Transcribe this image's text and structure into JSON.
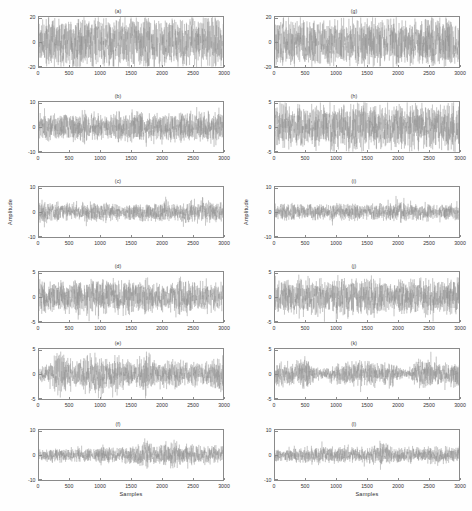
{
  "figure": {
    "layout": "6 rows x 2 columns of time-series subplots",
    "background_color": "#ffffff",
    "trace_color": "#8c8c8c",
    "axis_color": "#8a8a8a"
  },
  "axis_labels": {
    "xlabel": "Samples",
    "ylabel": "Amplitude"
  },
  "xticks": [
    "0",
    "500",
    "1000",
    "1500",
    "2000",
    "2500",
    "3000"
  ],
  "chart_data": [
    {
      "type": "line",
      "title": "(a)",
      "xlabel": "",
      "ylabel": "",
      "xlim": [
        0,
        3000
      ],
      "ylim": [
        -20,
        20
      ],
      "yticks": [
        20,
        0,
        -20
      ],
      "ytick_labels": [
        "20",
        "0",
        "-20"
      ],
      "xticks": [
        0,
        500,
        1000,
        1500,
        2000,
        2500,
        3000
      ],
      "grid": false,
      "legend": "none",
      "description": "Broadband white-noise-like signal, uniform dense oscillation",
      "envelope_peak": 17,
      "envelope": [
        0.92,
        0.97,
        0.9,
        1.0,
        0.95,
        0.88,
        0.97,
        0.93,
        1.0,
        0.9,
        0.95,
        0.98,
        0.91,
        0.96,
        0.94,
        0.99,
        0.9,
        0.95,
        0.97,
        0.92
      ],
      "noise_density": 1.0,
      "seed": 11
    },
    {
      "type": "line",
      "title": "(b)",
      "xlabel": "",
      "ylabel": "",
      "xlim": [
        0,
        3000
      ],
      "ylim": [
        -10,
        10
      ],
      "yticks": [
        10,
        0,
        -10
      ],
      "ytick_labels": [
        "10",
        "0",
        "-10"
      ],
      "xticks": [
        0,
        500,
        1000,
        1500,
        2000,
        2500,
        3000
      ],
      "grid": false,
      "legend": "none",
      "description": "Narrower-band oscillatory signal with moderate amplitude",
      "envelope_peak": 5.5,
      "envelope": [
        0.7,
        0.85,
        0.8,
        0.75,
        0.82,
        0.9,
        0.78,
        0.72,
        0.88,
        0.8,
        0.95,
        0.85,
        0.7,
        0.78,
        0.9,
        0.82,
        0.75,
        0.88,
        0.8,
        0.92
      ],
      "noise_density": 0.75,
      "seed": 23
    },
    {
      "type": "line",
      "title": "(c)",
      "xlabel": "",
      "ylabel": "Amplitude",
      "xlim": [
        0,
        3000
      ],
      "ylim": [
        -10,
        10
      ],
      "yticks": [
        10,
        0,
        -10
      ],
      "ytick_labels": [
        "10",
        "0",
        "-10"
      ],
      "xticks": [
        0,
        500,
        1000,
        1500,
        2000,
        2500,
        3000
      ],
      "grid": false,
      "legend": "none",
      "description": "Modulated signal with burst near sample 2600",
      "envelope_peak": 4.5,
      "envelope": [
        0.85,
        0.72,
        0.65,
        0.7,
        0.62,
        0.68,
        0.6,
        0.65,
        0.7,
        0.6,
        0.68,
        0.72,
        0.62,
        0.7,
        0.66,
        0.75,
        0.85,
        1.0,
        0.8,
        0.7
      ],
      "noise_density": 0.7,
      "seed": 37
    },
    {
      "type": "line",
      "title": "(d)",
      "xlabel": "",
      "ylabel": "",
      "xlim": [
        0,
        3000
      ],
      "ylim": [
        -5,
        5
      ],
      "yticks": [
        5,
        0,
        -5
      ],
      "ytick_labels": [
        "5",
        "0",
        "-5"
      ],
      "xticks": [
        0,
        500,
        1000,
        1500,
        2000,
        2500,
        3000
      ],
      "grid": false,
      "legend": "none",
      "description": "Dense modulated signal with transients near 1100 and 1500",
      "envelope_peak": 3.2,
      "envelope": [
        0.8,
        0.85,
        0.72,
        0.78,
        0.9,
        0.75,
        0.95,
        1.0,
        0.85,
        0.9,
        0.8,
        0.88,
        0.75,
        0.82,
        0.95,
        0.9,
        0.78,
        0.85,
        0.7,
        0.8
      ],
      "noise_density": 0.85,
      "seed": 53
    },
    {
      "type": "line",
      "title": "(e)",
      "xlabel": "",
      "ylabel": "",
      "xlim": [
        0,
        3000
      ],
      "ylim": [
        -5,
        5
      ],
      "yticks": [
        5,
        0,
        -5
      ],
      "ytick_labels": [
        "5",
        "0",
        "-5"
      ],
      "xticks": [
        0,
        500,
        1000,
        1500,
        2000,
        2500,
        3000
      ],
      "grid": false,
      "legend": "none",
      "description": "Strongly amplitude-modulated signal, large burst near sample 350 and sharp transient near 1700",
      "envelope_peak": 4.2,
      "envelope": [
        0.25,
        0.45,
        1.0,
        0.6,
        0.5,
        0.75,
        0.85,
        0.6,
        0.7,
        0.55,
        0.45,
        0.95,
        0.5,
        0.55,
        0.65,
        0.45,
        0.5,
        0.4,
        0.6,
        0.7
      ],
      "noise_density": 0.6,
      "seed": 71
    },
    {
      "type": "line",
      "title": "(f)",
      "xlabel": "Samples",
      "ylabel": "",
      "xlim": [
        0,
        3000
      ],
      "ylim": [
        -10,
        10
      ],
      "yticks": [
        10,
        0,
        -10
      ],
      "ytick_labels": [
        "10",
        "0",
        "-10"
      ],
      "xticks": [
        0,
        500,
        1000,
        1500,
        2000,
        2500,
        3000
      ],
      "grid": false,
      "legend": "none",
      "description": "Modulated signal with strongest bursts near samples 1700 and 2150",
      "envelope_peak": 5.0,
      "envelope": [
        0.35,
        0.5,
        0.45,
        0.4,
        0.5,
        0.42,
        0.55,
        0.5,
        0.45,
        0.6,
        0.55,
        1.0,
        0.6,
        0.7,
        0.95,
        0.6,
        0.65,
        0.55,
        0.6,
        0.5
      ],
      "noise_density": 0.65,
      "seed": 97
    },
    {
      "type": "line",
      "title": "(g)",
      "xlabel": "",
      "ylabel": "",
      "xlim": [
        0,
        3000
      ],
      "ylim": [
        -20,
        20
      ],
      "yticks": [
        20,
        0,
        -20
      ],
      "ytick_labels": [
        "20",
        "0",
        "-20"
      ],
      "xticks": [
        0,
        500,
        1000,
        1500,
        2000,
        2500,
        3000
      ],
      "grid": false,
      "legend": "none",
      "description": "Broadband white-noise-like signal, uniform dense oscillation",
      "envelope_peak": 16,
      "envelope": [
        0.95,
        0.9,
        0.97,
        0.93,
        1.0,
        0.92,
        0.96,
        0.94,
        0.9,
        0.98,
        0.93,
        0.95,
        0.99,
        0.91,
        0.96,
        0.93,
        0.97,
        0.92,
        0.95,
        0.9
      ],
      "noise_density": 1.0,
      "seed": 13
    },
    {
      "type": "line",
      "title": "(h)",
      "xlabel": "",
      "ylabel": "",
      "xlim": [
        0,
        3000
      ],
      "ylim": [
        -5,
        5
      ],
      "yticks": [
        5,
        0,
        -5
      ],
      "ytick_labels": [
        "5",
        "0",
        "-5"
      ],
      "xticks": [
        0,
        500,
        1000,
        1500,
        2000,
        2500,
        3000
      ],
      "grid": false,
      "legend": "none",
      "description": "Oscillatory signal with spiky peaks reaching near full scale",
      "envelope_peak": 4.4,
      "envelope": [
        0.75,
        0.9,
        0.82,
        0.78,
        0.88,
        0.8,
        0.95,
        0.85,
        0.9,
        1.0,
        0.82,
        0.78,
        0.92,
        0.85,
        0.8,
        0.88,
        0.75,
        0.85,
        0.9,
        0.95
      ],
      "noise_density": 0.7,
      "seed": 29
    },
    {
      "type": "line",
      "title": "(i)",
      "xlabel": "",
      "ylabel": "Amplitude",
      "xlim": [
        0,
        3000
      ],
      "ylim": [
        -10,
        10
      ],
      "yticks": [
        10,
        0,
        -10
      ],
      "ytick_labels": [
        "10",
        "0",
        "-10"
      ],
      "xticks": [
        0,
        500,
        1000,
        1500,
        2000,
        2500,
        3000
      ],
      "grid": false,
      "legend": "none",
      "description": "Modulated signal with downward transient near sample 2100",
      "envelope_peak": 4.2,
      "envelope": [
        0.7,
        0.62,
        0.68,
        0.6,
        0.65,
        0.58,
        0.66,
        0.62,
        0.7,
        0.64,
        0.6,
        0.68,
        0.62,
        0.95,
        0.7,
        0.6,
        0.65,
        0.58,
        0.66,
        0.62
      ],
      "noise_density": 0.72,
      "seed": 41
    },
    {
      "type": "line",
      "title": "(j)",
      "xlabel": "",
      "ylabel": "",
      "xlim": [
        0,
        3000
      ],
      "ylim": [
        -5,
        5
      ],
      "yticks": [
        5,
        0,
        -5
      ],
      "ytick_labels": [
        "5",
        "0",
        "-5"
      ],
      "xticks": [
        0,
        500,
        1000,
        1500,
        2000,
        2500,
        3000
      ],
      "grid": false,
      "legend": "none",
      "description": "Dense modulated signal spanning most of the vertical range",
      "envelope_peak": 3.4,
      "envelope": [
        0.78,
        0.85,
        0.8,
        0.95,
        0.88,
        0.82,
        0.9,
        1.0,
        0.85,
        0.8,
        0.92,
        0.86,
        0.8,
        0.88,
        0.82,
        0.9,
        0.84,
        0.8,
        0.86,
        0.9
      ],
      "noise_density": 0.85,
      "seed": 59
    },
    {
      "type": "line",
      "title": "(k)",
      "xlabel": "",
      "ylabel": "",
      "xlim": [
        0,
        3000
      ],
      "ylim": [
        -5,
        5
      ],
      "yticks": [
        5,
        0,
        -5
      ],
      "ytick_labels": [
        "5",
        "0",
        "-5"
      ],
      "xticks": [
        0,
        500,
        1000,
        1500,
        2000,
        2500,
        3000
      ],
      "grid": false,
      "legend": "none",
      "description": "Amplitude-modulated signal with quiet zones near samples 700 and 2250, bursts near 500 and 2500",
      "envelope_peak": 3.6,
      "envelope": [
        0.55,
        0.6,
        0.5,
        0.95,
        0.3,
        0.2,
        0.45,
        0.55,
        0.5,
        0.6,
        0.55,
        0.5,
        0.6,
        0.25,
        0.2,
        0.9,
        0.6,
        0.5,
        0.55,
        0.6
      ],
      "noise_density": 0.6,
      "seed": 83
    },
    {
      "type": "line",
      "title": "(l)",
      "xlabel": "Samples",
      "ylabel": "",
      "xlim": [
        0,
        3000
      ],
      "ylim": [
        -10,
        10
      ],
      "yticks": [
        10,
        0,
        -10
      ],
      "ytick_labels": [
        "10",
        "0",
        "-10"
      ],
      "xticks": [
        0,
        500,
        1000,
        1500,
        2000,
        2500,
        3000
      ],
      "grid": false,
      "legend": "none",
      "description": "Modulated signal with prominent burst near sample 1750",
      "envelope_peak": 5.2,
      "envelope": [
        0.45,
        0.4,
        0.5,
        0.45,
        0.55,
        0.6,
        0.5,
        0.45,
        0.52,
        0.48,
        0.55,
        1.0,
        0.6,
        0.5,
        0.55,
        0.45,
        0.5,
        0.55,
        0.48,
        0.5
      ],
      "noise_density": 0.65,
      "seed": 101
    }
  ]
}
